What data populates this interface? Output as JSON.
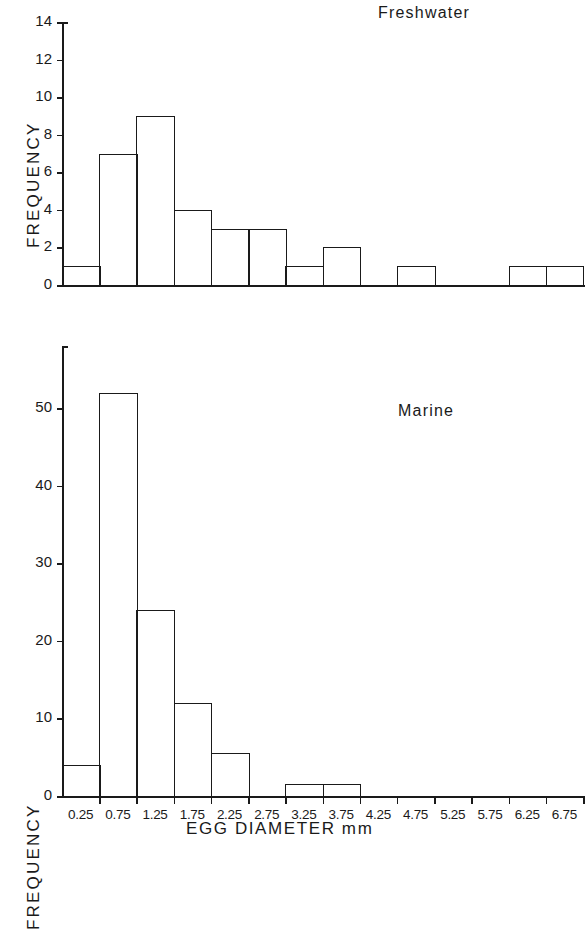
{
  "figure": {
    "xaxis_title": "EGG DIAMETER mm",
    "yaxis_title": "FREQUENCY",
    "bin_labels": [
      "0.25",
      "0.75",
      "1.25",
      "1.75",
      "2.25",
      "2.75",
      "3.25",
      "3.75",
      "4.25",
      "4.75",
      "5.25",
      "5.75",
      "6.25",
      "6.75"
    ]
  },
  "chart_data": [
    {
      "type": "bar",
      "title": "Freshwater",
      "xlabel": "EGG DIAMETER mm",
      "ylabel": "FREQUENCY",
      "categories": [
        "0.25",
        "0.75",
        "1.25",
        "1.75",
        "2.25",
        "2.75",
        "3.25",
        "3.75",
        "4.25",
        "4.75",
        "5.25",
        "5.75",
        "6.25",
        "6.75"
      ],
      "values": [
        1,
        7,
        9,
        4,
        3,
        3,
        1,
        2,
        0,
        1,
        0,
        0,
        1,
        1
      ],
      "ylim": [
        0,
        14
      ],
      "yticks": [
        0,
        2,
        4,
        6,
        8,
        10,
        12,
        14
      ],
      "ytick_labels": [
        "0",
        "2",
        "4",
        "6",
        "8",
        "10",
        "12",
        "14"
      ],
      "grid": false,
      "legend": "none"
    },
    {
      "type": "bar",
      "title": "Marine",
      "xlabel": "EGG DIAMETER mm",
      "ylabel": "FREQUENCY",
      "categories": [
        "0.25",
        "0.75",
        "1.25",
        "1.75",
        "2.25",
        "2.75",
        "3.25",
        "3.75",
        "4.25",
        "4.75",
        "5.25",
        "5.75",
        "6.25",
        "6.75"
      ],
      "values": [
        4,
        52,
        24,
        12,
        5.5,
        0,
        1.5,
        1.5,
        0,
        0,
        0,
        0,
        0,
        0
      ],
      "ylim": [
        0,
        58
      ],
      "yticks": [
        0,
        10,
        20,
        30,
        40,
        50
      ],
      "ytick_labels": [
        "0",
        "10",
        "20",
        "30",
        "40",
        "50"
      ],
      "grid": false,
      "legend": "none"
    }
  ]
}
